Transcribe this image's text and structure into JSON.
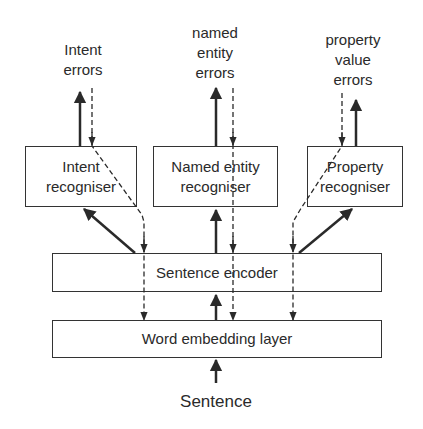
{
  "diagram": {
    "outputs": [
      {
        "id": "intent-errors",
        "label_lines": [
          "Intent",
          "errors"
        ]
      },
      {
        "id": "named-entity-errors",
        "label_lines": [
          "named",
          "entity",
          "errors"
        ]
      },
      {
        "id": "property-value-errors",
        "label_lines": [
          "property",
          "value",
          "errors"
        ]
      }
    ],
    "recognisers": [
      {
        "id": "intent-recogniser",
        "label_lines": [
          "Intent",
          "recogniser"
        ]
      },
      {
        "id": "named-entity-recogniser",
        "label_lines": [
          "Named entity",
          "recogniser"
        ]
      },
      {
        "id": "property-recogniser",
        "label_lines": [
          "Property",
          "recogniser"
        ]
      }
    ],
    "encoder": {
      "label": "Sentence encoder"
    },
    "embedding": {
      "label": "Word embedding layer"
    },
    "input": {
      "label": "Sentence"
    },
    "edges": [
      {
        "from": "Sentence",
        "to": "Word embedding layer",
        "style": "solid"
      },
      {
        "from": "Word embedding layer",
        "to": "Sentence encoder",
        "style": "solid"
      },
      {
        "from": "Sentence encoder",
        "to": "Intent recogniser",
        "style": "solid"
      },
      {
        "from": "Sentence encoder",
        "to": "Named entity recogniser",
        "style": "solid"
      },
      {
        "from": "Sentence encoder",
        "to": "Property recogniser",
        "style": "solid"
      },
      {
        "from": "Intent recogniser",
        "to": "Intent errors",
        "style": "solid"
      },
      {
        "from": "Named entity recogniser",
        "to": "named entity errors",
        "style": "solid"
      },
      {
        "from": "Property recogniser",
        "to": "property value errors",
        "style": "solid"
      },
      {
        "from": "Intent errors",
        "to": "Word embedding layer",
        "style": "dashed"
      },
      {
        "from": "named entity errors",
        "to": "Word embedding layer",
        "style": "dashed"
      },
      {
        "from": "property value errors",
        "to": "Word embedding layer",
        "style": "dashed"
      }
    ]
  },
  "colors": {
    "line": "#2a2a2a",
    "background": "#ffffff"
  }
}
